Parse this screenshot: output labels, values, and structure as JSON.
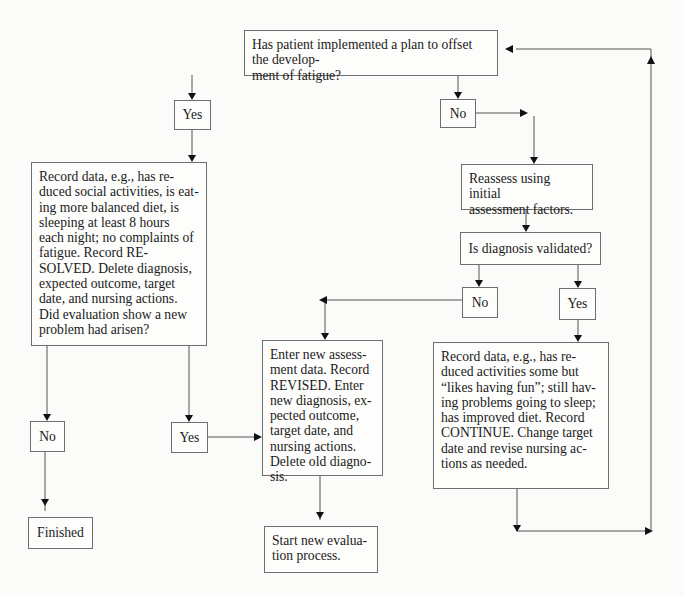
{
  "diagram": {
    "type": "flowchart",
    "nodes": {
      "q_plan": {
        "text": "Has patient implemented a plan to offset the develop-\nment of fatigue?"
      },
      "yes_plan": {
        "text": "Yes"
      },
      "no_plan": {
        "text": "No"
      },
      "record_resolved": {
        "text": "Record data, e.g., has re-\nduced social activities, is eat-\ning more balanced diet, is\nsleeping at least 8 hours\neach night; no complaints of\nfatigue. Record RE-\nSOLVED. Delete diagnosis,\nexpected outcome, target\ndate, and nursing actions.\nDid evaluation show a new\nproblem had arisen?"
      },
      "reassess": {
        "text": "Reassess using initial\nassessment factors."
      },
      "q_validated": {
        "text": "Is diagnosis validated?"
      },
      "no_validated": {
        "text": "No"
      },
      "yes_validated": {
        "text": "Yes"
      },
      "enter_new": {
        "text": "Enter new assess-\nment data. Record\nREVISED. Enter\nnew diagnosis, ex-\npected outcome,\ntarget date, and\nnursing actions.\nDelete old diagno-\nsis."
      },
      "record_continue": {
        "text": "Record data, e.g., has re-\nduced activities some but\n“likes having fun”; still hav-\ning problems going to sleep;\nhas improved diet. Record\nCONTINUE. Change target\ndate and revise nursing ac-\ntions as needed."
      },
      "no_new_problem": {
        "text": "No"
      },
      "yes_new_problem": {
        "text": "Yes"
      },
      "finished": {
        "text": "Finished"
      },
      "start_new_eval": {
        "text": "Start new evalua-\ntion process."
      }
    },
    "edges": [
      {
        "from": "q_plan",
        "to": "yes_plan"
      },
      {
        "from": "q_plan",
        "to": "no_plan"
      },
      {
        "from": "yes_plan",
        "to": "record_resolved"
      },
      {
        "from": "no_plan",
        "to": "reassess"
      },
      {
        "from": "reassess",
        "to": "q_validated"
      },
      {
        "from": "q_validated",
        "to": "no_validated"
      },
      {
        "from": "q_validated",
        "to": "yes_validated"
      },
      {
        "from": "no_validated",
        "to": "enter_new"
      },
      {
        "from": "yes_validated",
        "to": "record_continue"
      },
      {
        "from": "record_continue",
        "to": "q_plan"
      },
      {
        "from": "record_resolved",
        "to": "no_new_problem"
      },
      {
        "from": "record_resolved",
        "to": "yes_new_problem"
      },
      {
        "from": "no_new_problem",
        "to": "finished"
      },
      {
        "from": "yes_new_problem",
        "to": "enter_new"
      },
      {
        "from": "enter_new",
        "to": "start_new_eval"
      }
    ]
  }
}
